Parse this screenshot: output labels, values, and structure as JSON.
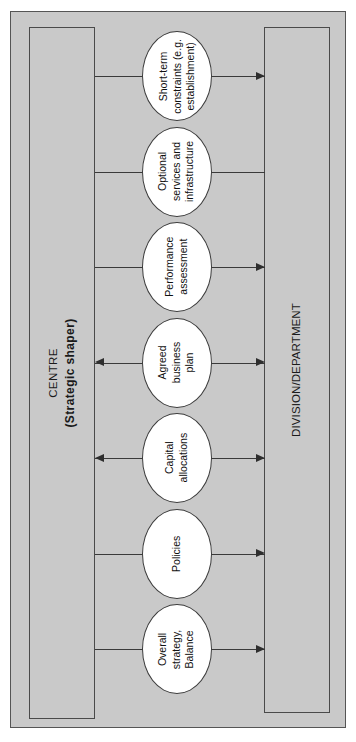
{
  "figure": {
    "background_color": "#c9c9c9",
    "node_fill_color": "#ffffff",
    "line_color": "#3a3a3a"
  },
  "left_column": {
    "name": "CENTRE",
    "role": "(Strategic shaper)"
  },
  "right_column": {
    "name": "DIVISION/DEPARTMENT"
  },
  "nodes": [
    {
      "id": "short-term-constraints",
      "lines": [
        "Short-term",
        "constraints (e.g.",
        "establishment)"
      ],
      "left_connector": "line",
      "right_connector": "arrow-right"
    },
    {
      "id": "optional-services",
      "lines": [
        "Optional",
        "services and",
        "infrastructure"
      ],
      "left_connector": "line",
      "right_connector": "line"
    },
    {
      "id": "performance-assessment",
      "lines": [
        "Performance",
        "assessment"
      ],
      "left_connector": "line",
      "right_connector": "arrow-right"
    },
    {
      "id": "agreed-business-plan",
      "lines": [
        "Agreed",
        "business",
        "plan"
      ],
      "left_connector": "arrow-left",
      "right_connector": "arrow-right"
    },
    {
      "id": "capital-allocations",
      "lines": [
        "Capital",
        "allocations"
      ],
      "left_connector": "arrow-left",
      "right_connector": "arrow-right"
    },
    {
      "id": "policies",
      "lines": [
        "Policies"
      ],
      "left_connector": "line",
      "right_connector": "arrow-right"
    },
    {
      "id": "overall-strategy-balance",
      "lines": [
        "Overall",
        "strategy,",
        "Balance"
      ],
      "left_connector": "line",
      "right_connector": "arrow-right"
    }
  ]
}
